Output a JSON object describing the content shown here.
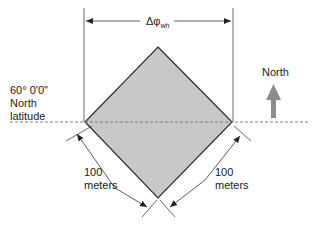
{
  "diagram": {
    "width_label": {
      "symbol": "Δφ",
      "subscript": "wh"
    },
    "latitude_label": {
      "line1": "60° 0'0\"",
      "line2": "North",
      "line3": "latitude"
    },
    "north_label": "North",
    "side_labels": [
      {
        "value": "100",
        "unit": "meters"
      },
      {
        "value": "100",
        "unit": "meters"
      }
    ],
    "colors": {
      "square_fill": "#c8c8c8",
      "square_stroke": "#2a2a2a",
      "line": "#333333",
      "dashed_line": "#777777",
      "north_arrow": "#8c8c8c"
    }
  }
}
